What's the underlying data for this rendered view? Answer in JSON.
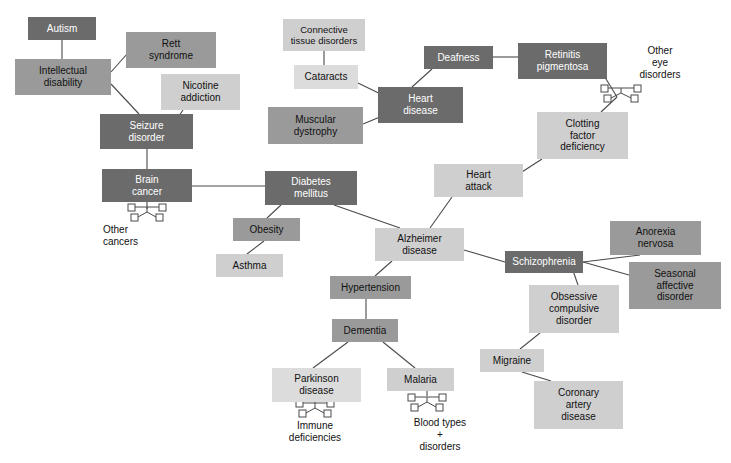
{
  "diagram": {
    "palette": {
      "dark": "#6b6b6b",
      "mid": "#9a9a9a",
      "light": "#cfcfcf",
      "very_light": "#dcdcdc",
      "edge": "#4a4a4a",
      "text_on_dark": "#ffffff",
      "text_on_light": "#111111",
      "background": "#ffffff"
    },
    "nodes": [
      {
        "id": "autism",
        "label": "Autism",
        "x": 28,
        "y": 17,
        "w": 68,
        "h": 23,
        "tone": "dark",
        "fs": 10
      },
      {
        "id": "intellectual_disability",
        "label": "Intellectual\ndisability",
        "x": 15,
        "y": 59,
        "w": 96,
        "h": 36,
        "tone": "mid",
        "fs": 10
      },
      {
        "id": "rett_syndrome",
        "label": "Rett\nsyndrome",
        "x": 126,
        "y": 32,
        "w": 90,
        "h": 36,
        "tone": "mid",
        "fs": 10
      },
      {
        "id": "nicotine_addiction",
        "label": "Nicotine\naddiction",
        "x": 161,
        "y": 74,
        "w": 79,
        "h": 36,
        "tone": "light",
        "fs": 10
      },
      {
        "id": "seizure_disorder",
        "label": "Seizure\ndisorder",
        "x": 100,
        "y": 114,
        "w": 93,
        "h": 35,
        "tone": "dark",
        "fs": 10
      },
      {
        "id": "brain_cancer",
        "label": "Brain\ncancer",
        "x": 102,
        "y": 169,
        "w": 90,
        "h": 33,
        "tone": "dark",
        "fs": 10
      },
      {
        "id": "diabetes_mellitus",
        "label": "Diabetes\nmellitus",
        "x": 265,
        "y": 171,
        "w": 92,
        "h": 34,
        "tone": "dark",
        "fs": 10
      },
      {
        "id": "obesity",
        "label": "Obesity",
        "x": 233,
        "y": 218,
        "w": 67,
        "h": 23,
        "tone": "mid",
        "fs": 10
      },
      {
        "id": "asthma",
        "label": "Asthma",
        "x": 216,
        "y": 254,
        "w": 67,
        "h": 23,
        "tone": "light",
        "fs": 10
      },
      {
        "id": "connective_tissue_disorders",
        "label": "Connective\ntissue disorders",
        "x": 283,
        "y": 19,
        "w": 82,
        "h": 32,
        "tone": "light",
        "fs": 9.5
      },
      {
        "id": "cataracts",
        "label": "Cataracts",
        "x": 294,
        "y": 65,
        "w": 64,
        "h": 24,
        "tone": "very_light",
        "fs": 10
      },
      {
        "id": "muscular_dystrophy",
        "label": "Muscular\ndystrophy",
        "x": 268,
        "y": 107,
        "w": 95,
        "h": 37,
        "tone": "mid",
        "fs": 10
      },
      {
        "id": "heart_disease",
        "label": "Heart\ndisease",
        "x": 378,
        "y": 87,
        "w": 85,
        "h": 36,
        "tone": "dark",
        "fs": 10
      },
      {
        "id": "deafness",
        "label": "Deafness",
        "x": 424,
        "y": 46,
        "w": 69,
        "h": 23,
        "tone": "dark",
        "fs": 10
      },
      {
        "id": "retinitis_pigmentosa",
        "label": "Retinitis\npigmentosa",
        "x": 518,
        "y": 43,
        "w": 89,
        "h": 36,
        "tone": "dark",
        "fs": 10
      },
      {
        "id": "clotting_factor_deficiency",
        "label": "Clotting\nfactor\ndeficiency",
        "x": 537,
        "y": 112,
        "w": 91,
        "h": 47,
        "tone": "light",
        "fs": 10
      },
      {
        "id": "heart_attack",
        "label": "Heart\nattack",
        "x": 434,
        "y": 164,
        "w": 89,
        "h": 33,
        "tone": "light",
        "fs": 10
      },
      {
        "id": "alzheimer_disease",
        "label": "Alzheimer\ndisease",
        "x": 375,
        "y": 228,
        "w": 89,
        "h": 33,
        "tone": "light",
        "fs": 10
      },
      {
        "id": "hypertension",
        "label": "Hypertension",
        "x": 330,
        "y": 276,
        "w": 81,
        "h": 23,
        "tone": "mid",
        "fs": 10
      },
      {
        "id": "dementia",
        "label": "Dementia",
        "x": 332,
        "y": 319,
        "w": 66,
        "h": 23,
        "tone": "mid",
        "fs": 10
      },
      {
        "id": "parkinson_disease",
        "label": "Parkinson\ndisease",
        "x": 272,
        "y": 368,
        "w": 89,
        "h": 34,
        "tone": "very_light",
        "fs": 10
      },
      {
        "id": "malaria",
        "label": "Malaria",
        "x": 387,
        "y": 368,
        "w": 67,
        "h": 23,
        "tone": "light",
        "fs": 10
      },
      {
        "id": "schizophrenia",
        "label": "Schizophrenia",
        "x": 505,
        "y": 251,
        "w": 78,
        "h": 22,
        "tone": "dark",
        "fs": 10
      },
      {
        "id": "anorexia_nervosa",
        "label": "Anorexia\nnervosa",
        "x": 610,
        "y": 221,
        "w": 91,
        "h": 34,
        "tone": "mid",
        "fs": 10
      },
      {
        "id": "seasonal_affective_disorder",
        "label": "Seasonal\naffective\ndisorder",
        "x": 629,
        "y": 262,
        "w": 92,
        "h": 47,
        "tone": "mid",
        "fs": 10
      },
      {
        "id": "obsessive_compulsive_disorder",
        "label": "Obsessive\ncompulsive\ndisorder",
        "x": 529,
        "y": 285,
        "w": 90,
        "h": 48,
        "tone": "light",
        "fs": 10
      },
      {
        "id": "migraine",
        "label": "Migraine",
        "x": 480,
        "y": 349,
        "w": 64,
        "h": 23,
        "tone": "light",
        "fs": 10
      },
      {
        "id": "coronary_artery_disease",
        "label": "Coronary\nartery\ndisease",
        "x": 534,
        "y": 381,
        "w": 89,
        "h": 48,
        "tone": "light",
        "fs": 10
      }
    ],
    "free_labels": [
      {
        "id": "other_cancers",
        "label": "Other\ncancers",
        "x": 103,
        "y": 222,
        "w": 70,
        "h": 28,
        "fs": 10,
        "align": "left"
      },
      {
        "id": "other_eye_disorders",
        "label": "Other\neye\ndisorders",
        "x": 625,
        "y": 42,
        "w": 70,
        "h": 42,
        "fs": 10,
        "align": "center"
      },
      {
        "id": "immune_deficiencies",
        "label": "Immune\ndeficiencies",
        "x": 270,
        "y": 418,
        "w": 90,
        "h": 28,
        "fs": 10,
        "align": "center"
      },
      {
        "id": "blood_types_disorders",
        "label": "Blood types\n+\ndisorders",
        "x": 395,
        "y": 414,
        "w": 90,
        "h": 42,
        "fs": 10,
        "align": "center"
      }
    ],
    "pedigree_clusters": [
      {
        "id": "pedigree-other-cancers",
        "x": 128,
        "y": 203,
        "w": 38,
        "h": 20
      },
      {
        "id": "pedigree-other-eye-disorders",
        "x": 601,
        "y": 84,
        "w": 40,
        "h": 24
      },
      {
        "id": "pedigree-immune-deficiencies",
        "x": 296,
        "y": 399,
        "w": 38,
        "h": 22
      },
      {
        "id": "pedigree-blood-types",
        "x": 408,
        "y": 393,
        "w": 38,
        "h": 22
      }
    ],
    "edges": [
      {
        "from": "autism",
        "to": "intellectual_disability",
        "x1": 62,
        "y1": 40,
        "x2": 62,
        "y2": 59
      },
      {
        "from": "intellectual_disability",
        "to": "rett_syndrome",
        "x1": 111,
        "y1": 72,
        "x2": 127,
        "y2": 54
      },
      {
        "from": "intellectual_disability",
        "to": "seizure_disorder",
        "x1": 111,
        "y1": 84,
        "x2": 139,
        "y2": 114
      },
      {
        "from": "nicotine_addiction",
        "to": "seizure_disorder",
        "x1": 183,
        "y1": 110,
        "x2": 165,
        "y2": 136
      },
      {
        "from": "seizure_disorder",
        "to": "brain_cancer",
        "x1": 147,
        "y1": 149,
        "x2": 147,
        "y2": 169
      },
      {
        "from": "brain_cancer",
        "to": "brain_cancer_pedigree",
        "x1": 147,
        "y1": 202,
        "x2": 147,
        "y2": 209
      },
      {
        "from": "brain_cancer",
        "to": "diabetes_mellitus",
        "x1": 192,
        "y1": 186,
        "x2": 265,
        "y2": 186
      },
      {
        "from": "diabetes_mellitus",
        "to": "obesity",
        "x1": 281,
        "y1": 205,
        "x2": 267,
        "y2": 218
      },
      {
        "from": "obesity",
        "to": "asthma",
        "x1": 264,
        "y1": 241,
        "x2": 247,
        "y2": 254
      },
      {
        "from": "diabetes_mellitus",
        "to": "alzheimer_disease",
        "x1": 334,
        "y1": 205,
        "x2": 400,
        "y2": 228
      },
      {
        "from": "connective_tissue_disorders",
        "to": "cataracts",
        "x1": 324,
        "y1": 51,
        "x2": 324,
        "y2": 65
      },
      {
        "from": "cataracts",
        "to": "heart_disease",
        "x1": 358,
        "y1": 83,
        "x2": 395,
        "y2": 101
      },
      {
        "from": "muscular_dystrophy",
        "to": "heart_disease",
        "x1": 363,
        "y1": 124,
        "x2": 392,
        "y2": 112
      },
      {
        "from": "deafness",
        "to": "heart_disease",
        "x1": 432,
        "y1": 69,
        "x2": 412,
        "y2": 87
      },
      {
        "from": "deafness",
        "to": "retinitis_pigmentosa",
        "x1": 493,
        "y1": 57,
        "x2": 518,
        "y2": 57
      },
      {
        "from": "retinitis_pigmentosa",
        "to": "other_eye_pedigree",
        "x1": 603,
        "y1": 74,
        "x2": 617,
        "y2": 97
      },
      {
        "from": "other_eye_pedigree",
        "to": "clotting_factor_deficiency",
        "x1": 617,
        "y1": 97,
        "x2": 601,
        "y2": 112
      },
      {
        "from": "clotting_factor_deficiency",
        "to": "heart_attack",
        "x1": 542,
        "y1": 159,
        "x2": 508,
        "y2": 181
      },
      {
        "from": "heart_attack",
        "to": "alzheimer_disease",
        "x1": 452,
        "y1": 197,
        "x2": 430,
        "y2": 228
      },
      {
        "from": "alzheimer_disease",
        "to": "hypertension",
        "x1": 392,
        "y1": 261,
        "x2": 375,
        "y2": 276
      },
      {
        "from": "alzheimer_disease",
        "to": "schizophrenia",
        "x1": 464,
        "y1": 250,
        "x2": 505,
        "y2": 262
      },
      {
        "from": "schizophrenia",
        "to": "anorexia_nervosa",
        "x1": 583,
        "y1": 262,
        "x2": 640,
        "y2": 255
      },
      {
        "from": "schizophrenia",
        "to": "seasonal_affective_disorder",
        "x1": 583,
        "y1": 262,
        "x2": 629,
        "y2": 275
      },
      {
        "from": "schizophrenia",
        "to": "obsessive_compulsive_disorder",
        "x1": 570,
        "y1": 262,
        "x2": 578,
        "y2": 285
      },
      {
        "from": "obsessive_compulsive_disorder",
        "to": "migraine",
        "x1": 540,
        "y1": 333,
        "x2": 520,
        "y2": 349
      },
      {
        "from": "migraine",
        "to": "coronary_artery_disease",
        "x1": 522,
        "y1": 372,
        "x2": 551,
        "y2": 381
      },
      {
        "from": "hypertension",
        "to": "dementia",
        "x1": 366,
        "y1": 299,
        "x2": 366,
        "y2": 319
      },
      {
        "from": "dementia",
        "to": "parkinson_disease",
        "x1": 348,
        "y1": 342,
        "x2": 313,
        "y2": 368
      },
      {
        "from": "dementia",
        "to": "malaria",
        "x1": 383,
        "y1": 342,
        "x2": 415,
        "y2": 368
      },
      {
        "from": "parkinson_disease",
        "to": "immune_pedigree",
        "x1": 315,
        "y1": 402,
        "x2": 315,
        "y2": 403
      },
      {
        "from": "malaria",
        "to": "blood_types_pedigree",
        "x1": 427,
        "y1": 391,
        "x2": 427,
        "y2": 396
      }
    ]
  }
}
